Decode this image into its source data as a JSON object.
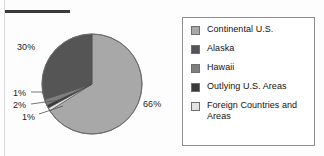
{
  "figure": {
    "background_color": "#fdfdfd",
    "rule_color": "#3a3a3a"
  },
  "chart_data": {
    "type": "pie",
    "title": "",
    "subtitle": "",
    "xlabel": "",
    "ylabel": "",
    "legend_position": "right",
    "grid": false,
    "categories": [
      "Continental U.S.",
      "Alaska",
      "Hawaii",
      "Outlying U.S. Areas",
      "Foreign Countries and Areas"
    ],
    "values": [
      66,
      30,
      2,
      1,
      1
    ],
    "value_labels": [
      "66%",
      "30%",
      "2%",
      "1%",
      "1%"
    ],
    "colors": [
      "#a8a8a8",
      "#555555",
      "#7e7e7e",
      "#3a3a3a",
      "#e2e2e2"
    ],
    "slice_order_clockwise_from_top": [
      "Continental U.S.",
      "Foreign Countries and Areas",
      "Outlying U.S. Areas",
      "Hawaii",
      "Alaska"
    ],
    "annotations": [
      {
        "text": "30%",
        "position": "left"
      },
      {
        "text": "1%",
        "position": "lower-left"
      },
      {
        "text": "2%",
        "position": "lower-left"
      },
      {
        "text": "1%",
        "position": "lower-left"
      },
      {
        "text": "66%",
        "position": "right"
      }
    ]
  },
  "pie": {
    "outline_color": "#6a6a6a",
    "labels": {
      "alaska_pct": "30%",
      "continental_pct": "66%",
      "thin_top_pct": "1%",
      "thin_mid_pct": "2%",
      "thin_bottom_pct": "1%"
    }
  },
  "legend": {
    "border_color": "#8e8e8e",
    "items": [
      {
        "label": "Continental U.S.",
        "color": "#a8a8a8",
        "swatch_icon": "color-swatch-icon"
      },
      {
        "label": "Alaska",
        "color": "#555555",
        "swatch_icon": "color-swatch-icon"
      },
      {
        "label": "Hawaii",
        "color": "#7e7e7e",
        "swatch_icon": "color-swatch-icon"
      },
      {
        "label": "Outlying U.S. Areas",
        "color": "#3a3a3a",
        "swatch_icon": "color-swatch-icon"
      },
      {
        "label": "Foreign Countries and Areas",
        "color": "#e2e2e2",
        "swatch_icon": "color-swatch-icon"
      }
    ]
  }
}
